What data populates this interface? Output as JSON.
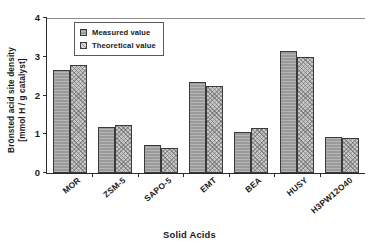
{
  "chart_data": {
    "type": "bar",
    "title": "",
    "categories": [
      "MOR",
      "ZSM-5",
      "SAPO-5",
      "EMT",
      "BEA",
      "HUSY",
      "H3PW12O40"
    ],
    "series": [
      {
        "name": "Measured value",
        "values": [
          2.66,
          1.19,
          0.72,
          2.35,
          1.06,
          3.15,
          0.93
        ]
      },
      {
        "name": "Theoretical value",
        "values": [
          2.79,
          1.24,
          0.65,
          2.25,
          1.16,
          2.99,
          0.9
        ]
      }
    ],
    "xlabel": "Solid Acids",
    "ylabel_line1": "Brönsted acid site density",
    "ylabel_line2": "[mmol H / g catalyst]",
    "ylim": [
      0,
      4
    ],
    "yticks": [
      0,
      1,
      2,
      3,
      4
    ],
    "ytick_labels": [
      "0",
      "1",
      "2",
      "3",
      "4"
    ],
    "grid": false,
    "legend_position": "top-left-inside",
    "colors": {
      "measured": "#9a9a9a",
      "theoretical": "#c9c9c9",
      "axis": "#2b2b2b",
      "bar_edge": "#3a3a3a",
      "background": "#ffffff"
    }
  }
}
